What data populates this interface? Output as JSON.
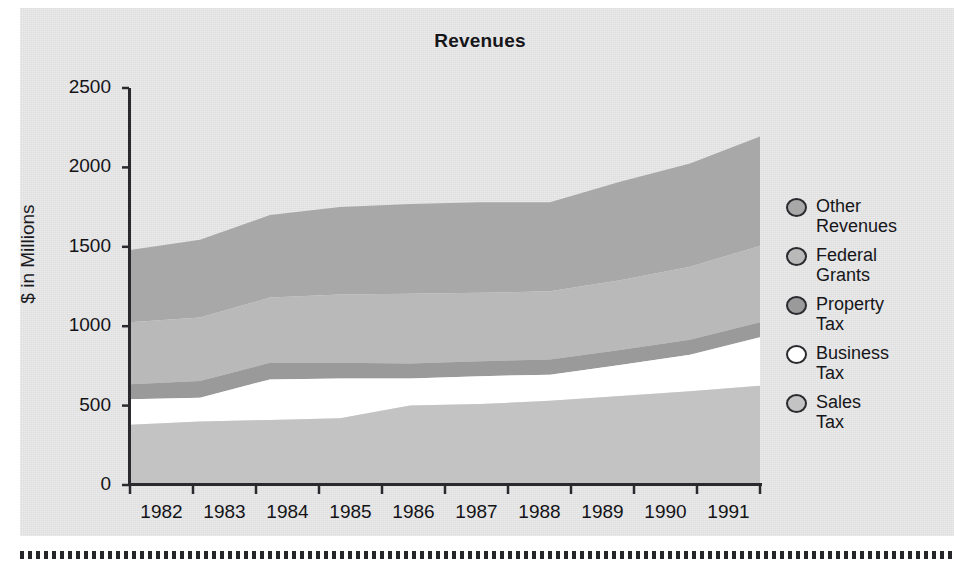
{
  "chart_title": "Revenues",
  "y_axis_label": "$ in Millions",
  "axis": {
    "y_ticks": [
      "0",
      "500",
      "1000",
      "1500",
      "2000",
      "2500"
    ],
    "x_ticks": [
      "1982",
      "1983",
      "1984",
      "1985",
      "1986",
      "1987",
      "1988",
      "1989",
      "1990",
      "1991"
    ]
  },
  "legend": {
    "items": [
      {
        "label": "Other\nRevenues",
        "swatch": "#a8a8a8",
        "icon": "ellipse-swatch-icon"
      },
      {
        "label": "Federal\nGrants",
        "swatch": "#b9b9b9",
        "icon": "ellipse-swatch-icon"
      },
      {
        "label": "Property\nTax",
        "swatch": "#9a9a9a",
        "icon": "ellipse-swatch-icon"
      },
      {
        "label": "Business\nTax",
        "swatch": "#ffffff",
        "icon": "ellipse-swatch-icon"
      },
      {
        "label": "Sales\nTax",
        "swatch": "#c3c3c3",
        "icon": "ellipse-swatch-icon"
      }
    ]
  },
  "colors": {
    "panel_background": "#e3e3e3",
    "axis_line": "#2a2a2e",
    "sales_tax": "#c3c3c3",
    "business_tax": "#ffffff",
    "property_tax": "#9a9a9a",
    "federal_grants": "#b9b9b9",
    "other_revenues": "#a8a8a8"
  },
  "chart_data": {
    "type": "area",
    "stacked": true,
    "title": "Revenues",
    "xlabel": "",
    "ylabel": "$ in Millions",
    "ylim": [
      0,
      2500
    ],
    "grid": false,
    "legend_position": "right",
    "categories": [
      "1982",
      "1983",
      "1984",
      "1985",
      "1986",
      "1987",
      "1988",
      "1989",
      "1990",
      "1991"
    ],
    "series": [
      {
        "name": "Sales Tax",
        "color": "#c3c3c3",
        "values": [
          380,
          400,
          410,
          420,
          500,
          510,
          530,
          560,
          590,
          625
        ]
      },
      {
        "name": "Business Tax",
        "color": "#ffffff",
        "values": [
          160,
          150,
          255,
          250,
          170,
          175,
          165,
          195,
          230,
          305
        ]
      },
      {
        "name": "Property Tax",
        "color": "#9a9a9a",
        "values": [
          95,
          105,
          105,
          100,
          95,
          95,
          95,
          95,
          95,
          95
        ]
      },
      {
        "name": "Federal Grants",
        "color": "#b9b9b9",
        "values": [
          390,
          400,
          410,
          430,
          440,
          430,
          430,
          440,
          460,
          480
        ]
      },
      {
        "name": "Other Revenues",
        "color": "#a8a8a8",
        "values": [
          455,
          490,
          520,
          550,
          565,
          570,
          560,
          620,
          650,
          690
        ]
      }
    ],
    "cumulative_tops": {
      "Sales Tax": [
        380,
        400,
        410,
        420,
        500,
        510,
        530,
        560,
        590,
        625
      ],
      "Business Tax": [
        540,
        550,
        665,
        670,
        670,
        685,
        695,
        755,
        820,
        930
      ],
      "Property Tax": [
        635,
        655,
        770,
        770,
        765,
        780,
        790,
        850,
        915,
        1025
      ],
      "Federal Grants": [
        1025,
        1055,
        1180,
        1200,
        1205,
        1210,
        1220,
        1290,
        1375,
        1505
      ],
      "Other Revenues": [
        1480,
        1545,
        1700,
        1750,
        1770,
        1780,
        1780,
        1910,
        2025,
        2195
      ]
    }
  }
}
